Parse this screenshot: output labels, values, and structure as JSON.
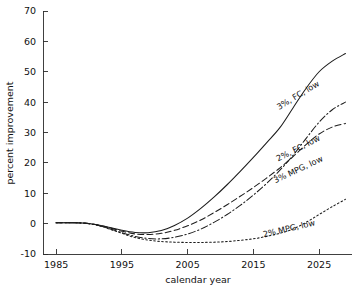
{
  "chart_data": {
    "type": "line",
    "title": "",
    "xlabel": "calendar year",
    "ylabel": "percent improvement",
    "xlim": [
      1983,
      2030
    ],
    "ylim": [
      -10,
      70
    ],
    "xticks": [
      1985,
      1995,
      2005,
      2015,
      2025
    ],
    "yticks": [
      -10,
      0,
      10,
      20,
      30,
      40,
      50,
      60,
      70
    ],
    "xtick_labels": [
      "1985",
      "1995",
      "2005",
      "2015",
      "2025"
    ],
    "ytick_labels": [
      "-10",
      "0",
      "10",
      "20",
      "30",
      "40",
      "50",
      "60",
      "70"
    ],
    "grid": false,
    "legend_position": "inline-curve-labels",
    "x": [
      1985,
      1987,
      1989,
      1991,
      1993,
      1995,
      1997,
      1999,
      2001,
      2003,
      2005,
      2007,
      2009,
      2011,
      2013,
      2015,
      2017,
      2019,
      2021,
      2023,
      2025,
      2027,
      2029
    ],
    "series": [
      {
        "name": "3%, FC, low",
        "label": "3%, FC, low",
        "style": "solid",
        "label_x": 2022.0,
        "label_y": 41.5,
        "label_angle": -31,
        "values": [
          0.3,
          0.3,
          0.2,
          -0.3,
          -1.2,
          -2.2,
          -2.9,
          -3.0,
          -2.3,
          -0.6,
          1.8,
          5.0,
          8.7,
          12.8,
          17.2,
          21.8,
          26.6,
          31.5,
          38.0,
          44.5,
          50.0,
          53.5,
          56.0
        ]
      },
      {
        "name": "2%, FC, low",
        "label": "2%, FC, low",
        "style": "dashdot",
        "label_x": 2022.0,
        "label_y": 24.0,
        "label_angle": -27,
        "values": [
          0.3,
          0.3,
          0.2,
          -0.4,
          -1.6,
          -3.0,
          -4.2,
          -4.9,
          -5.0,
          -4.5,
          -3.4,
          -1.8,
          0.4,
          3.0,
          6.0,
          9.4,
          13.2,
          17.5,
          22.4,
          28.0,
          33.4,
          37.5,
          40.0
        ]
      },
      {
        "name": "3% MPG, low",
        "label": "3% MPG, low",
        "style": "dashed",
        "label_x": 2022.0,
        "label_y": 17.0,
        "label_angle": -25,
        "values": [
          0.3,
          0.3,
          0.2,
          -0.3,
          -1.3,
          -2.5,
          -3.4,
          -3.6,
          -3.2,
          -2.2,
          -0.7,
          1.2,
          3.6,
          6.2,
          9.0,
          11.9,
          15.0,
          18.3,
          22.0,
          26.0,
          29.5,
          31.8,
          33.0
        ]
      },
      {
        "name": "2% MPG, low",
        "label": "2% MPG, low",
        "style": "dotted",
        "label_x": 2020.5,
        "label_y": -2.5,
        "label_angle": -13,
        "values": [
          0.3,
          0.3,
          0.2,
          -0.4,
          -1.7,
          -3.2,
          -4.6,
          -5.4,
          -5.9,
          -6.1,
          -6.2,
          -6.2,
          -6.1,
          -5.9,
          -5.5,
          -5.0,
          -4.2,
          -3.2,
          -1.8,
          0.4,
          3.0,
          5.6,
          8.0
        ]
      }
    ]
  }
}
